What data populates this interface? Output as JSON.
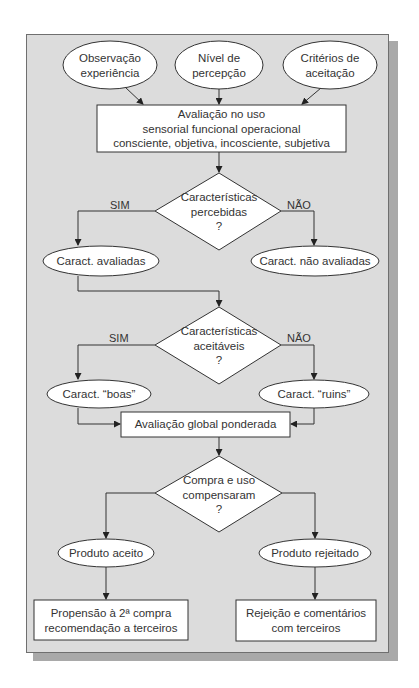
{
  "diagram": {
    "inputs": [
      {
        "line1": "Observação",
        "line2": "experiência"
      },
      {
        "line1": "Nível de",
        "line2": "percepção"
      },
      {
        "line1": "Critérios de",
        "line2": "aceitação"
      }
    ],
    "evaluation_box": {
      "line1": "Avaliação no uso",
      "line2": "sensorial funcional operacional",
      "line3": "consciente, objetiva, incosciente, subjetiva"
    },
    "decision1": {
      "line1": "Características",
      "line2": "percebidas",
      "line3": "?",
      "yes": "SIM",
      "no": "NÃO"
    },
    "outcome1_yes": "Caract. avaliadas",
    "outcome1_no": "Caract. não avaliadas",
    "decision2": {
      "line1": "Características",
      "line2": "aceitáveis",
      "line3": "?",
      "yes": "SIM",
      "no": "NÃO"
    },
    "outcome2_yes": "Caract. “boas”",
    "outcome2_no": "Caract. “ruins”",
    "global_box": "Avaliação global ponderada",
    "decision3": {
      "line1": "Compra e uso",
      "line2": "compensaram",
      "line3": "?"
    },
    "outcome3_yes": "Produto aceito",
    "outcome3_no": "Produto rejeitado",
    "final_yes": {
      "line1": "Propensão à 2ª compra",
      "line2": "recomendação a terceiros"
    },
    "final_no": {
      "line1": "Rejeição e comentários",
      "line2": "com terceiros"
    }
  }
}
